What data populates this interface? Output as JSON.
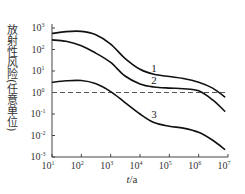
{
  "chart_data": {
    "type": "line",
    "title": "",
    "xlabel": "t/a",
    "ylabel": "放射性风险(任意单位)",
    "xscale": "log",
    "yscale": "log",
    "xlim": [
      10,
      10000000
    ],
    "ylim": [
      0.001,
      1000
    ],
    "x_ticks": [
      "10^1",
      "10^2",
      "10^3",
      "10^4",
      "10^5",
      "10^6",
      "10^7"
    ],
    "y_ticks": [
      "10^-3",
      "10^-2",
      "10^-1",
      "10^0",
      "10^1",
      "10^2",
      "10^3"
    ],
    "grid": false,
    "reference_line": {
      "y": 1,
      "style": "dashed"
    },
    "series": [
      {
        "name": "1",
        "x": [
          10,
          30,
          100,
          300,
          1000,
          3000,
          10000,
          30000,
          100000,
          300000,
          1000000,
          3000000,
          8000000
        ],
        "y": [
          550,
          680,
          700,
          500,
          180,
          40,
          12,
          7,
          5.5,
          4.5,
          3,
          1.6,
          0.6
        ]
      },
      {
        "name": "2",
        "x": [
          10,
          30,
          100,
          300,
          1000,
          3000,
          10000,
          30000,
          100000,
          300000,
          1000000,
          3000000,
          8000000
        ],
        "y": [
          280,
          240,
          150,
          70,
          25,
          6,
          2.5,
          1.8,
          1.6,
          1.5,
          1.2,
          0.45,
          0.13
        ]
      },
      {
        "name": "3",
        "x": [
          10,
          30,
          100,
          300,
          1000,
          3000,
          10000,
          30000,
          100000,
          300000,
          1000000,
          3000000,
          8000000
        ],
        "y": [
          3,
          3.5,
          3.6,
          2.6,
          1.1,
          0.35,
          0.1,
          0.04,
          0.027,
          0.022,
          0.014,
          0.006,
          0.0022
        ]
      }
    ]
  }
}
